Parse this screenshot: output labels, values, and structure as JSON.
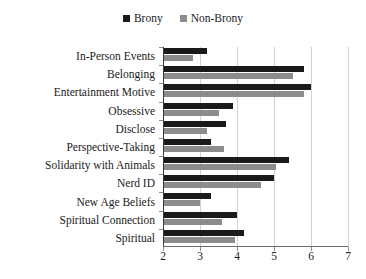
{
  "chart_data": {
    "type": "bar",
    "orientation": "horizontal",
    "title": "",
    "xlabel": "",
    "ylabel": "",
    "xlim": [
      2,
      7
    ],
    "xticks": [
      2,
      3,
      4,
      5,
      6,
      7
    ],
    "xtick_labels": [
      "2",
      "3",
      "4",
      "5",
      "6",
      "7"
    ],
    "grid": true,
    "legend_position": "top-center",
    "categories": [
      "In-Person Events",
      "Belonging",
      "Entertainment Motive",
      "Obsessive",
      "Disclose",
      "Perspective-Taking",
      "Solidarity with Animals",
      "Nerd ID",
      "New Age Beliefs",
      "Spiritual Connection",
      "Spiritual"
    ],
    "series": [
      {
        "name": "Brony",
        "color": "#1a1a1a",
        "values": [
          3.2,
          5.8,
          6.0,
          3.9,
          3.7,
          3.3,
          5.4,
          5.0,
          3.3,
          4.0,
          4.2
        ]
      },
      {
        "name": "Non-Brony",
        "color": "#8c8c8c",
        "values": [
          2.8,
          5.5,
          5.8,
          3.5,
          3.2,
          3.65,
          5.05,
          4.65,
          3.0,
          3.6,
          3.95
        ]
      }
    ]
  },
  "legend": {
    "entries": [
      {
        "label": "Brony",
        "swatch": "legend-swatch-brony",
        "color": "#1a1a1a"
      },
      {
        "label": "Non-Brony",
        "swatch": "legend-swatch-non-brony",
        "color": "#8c8c8c"
      }
    ]
  }
}
